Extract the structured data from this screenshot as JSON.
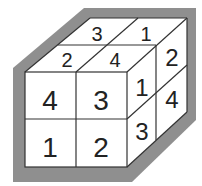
{
  "diagram": {
    "colors": {
      "frame": "#8f8f8f",
      "face": "#ffffff",
      "line": "#333333",
      "text": "#222222"
    },
    "front_face": {
      "cells": [
        "4",
        "3",
        "1",
        "2"
      ]
    },
    "top_face": {
      "cells": [
        "3",
        "1",
        "2",
        "4"
      ]
    },
    "right_face": {
      "cells": [
        "1",
        "2",
        "3",
        "4"
      ]
    }
  }
}
